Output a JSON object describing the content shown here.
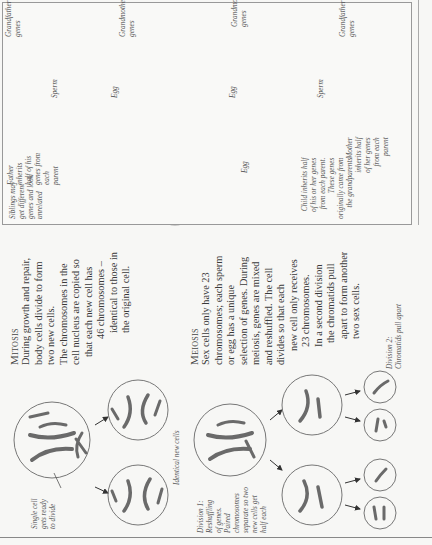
{
  "mitosis": {
    "title": "Mitosis",
    "lines": [
      "During growth and repair,",
      "body cells divide to form",
      "two new cells.",
      "The chromosomes in the",
      "cell nucleus are copied so",
      "that each new cell has",
      "46 chromosomes –",
      "identical to those in",
      "the original cell."
    ],
    "captions": {
      "single_cell": [
        "Single cell",
        "gets ready",
        "to divide"
      ],
      "identical": "Identical new cells"
    }
  },
  "meiosis": {
    "title": "Meiosis",
    "lines": [
      "Sex cells only have 23",
      "chromosomes; each sperm",
      "or egg has a unique",
      "selection of genes. During",
      "meiosis, genes are mixed",
      "and reshuffled. The cell",
      "divides so that each",
      "new cell only receives",
      "23 chromosomes.",
      "In a second division",
      "the chromatids pull",
      "apart to form another",
      "two sex cells."
    ],
    "captions": {
      "division1": [
        "Division 1:",
        "Reshuffling",
        "of genes.",
        "Paired",
        "chromosomes",
        "separate so two",
        "new cells get",
        "half each"
      ],
      "division2": [
        "Division 2:",
        "Chromatids pull apart"
      ]
    }
  },
  "heredity": {
    "title": "Heredity",
    "lines": [
      "Genes are passed on from generation to",
      "generation. A baby gets half its genes from",
      "its mother, half from its father. A quarter of",
      "a baby's genes comes from each of the four",
      "grandparents. Reshuffling of genes during",
      "meiosis means that brothers and sisters",
      "inherit different genes from the parents,",
      "although family resemblances can occur."
    ],
    "labels": {
      "grandfather_left": [
        "Grandfather's",
        "genes"
      ],
      "grandmother_left": [
        "Grandmother's",
        "genes"
      ],
      "grandmother_right": [
        "Grandmother's",
        "genes"
      ],
      "grandfather_right": [
        "Grandfather's",
        "genes"
      ],
      "sperm_left": "Sperm",
      "egg_left": "Egg",
      "egg_right": "Egg",
      "sperm_right": "Sperm",
      "egg_mother": "Egg",
      "father": [
        "Father",
        "inherits",
        "half of his",
        "genes from",
        "each",
        "parent"
      ],
      "mother": [
        "Mother",
        "inherits half",
        "of her genes",
        "from each",
        "parent"
      ],
      "child": [
        "Child inherits half",
        "of his or her genes",
        "from each parent.",
        "These genes",
        "originally came from",
        "the grandparents"
      ],
      "siblings": [
        "Siblings may",
        "get different",
        "genes and look",
        "unrelated"
      ]
    }
  },
  "colors": {
    "ink": "#333333",
    "chromosome": "#6a6a6a",
    "cell_ring": "#999999",
    "arrow_fill": "#e6e6e4"
  }
}
